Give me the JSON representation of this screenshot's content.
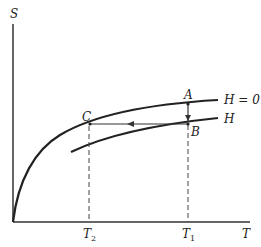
{
  "diagram": {
    "axes": {
      "y_label": "S",
      "x_label": "T"
    },
    "curves": [
      {
        "id": "h0",
        "label": "H = 0"
      },
      {
        "id": "h",
        "label": "H"
      }
    ],
    "points": {
      "A": "A",
      "B": "B",
      "C": "C"
    },
    "ticks": {
      "T1": "T",
      "T1_sub": "1",
      "T2": "T",
      "T2_sub": "2"
    }
  }
}
